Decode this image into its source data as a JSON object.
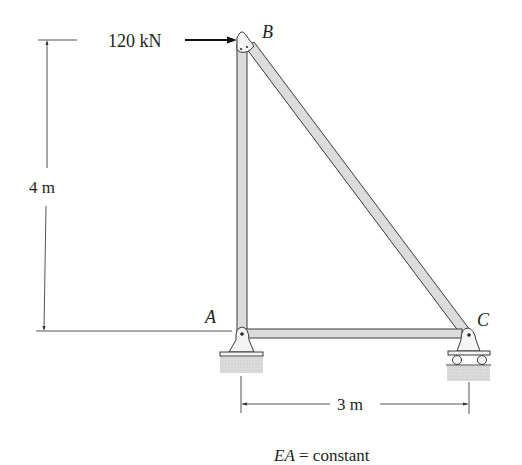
{
  "figure": {
    "type": "truss",
    "joints": [
      {
        "id": "A",
        "label": "A",
        "support": "pin"
      },
      {
        "id": "B",
        "label": "B",
        "support": "none"
      },
      {
        "id": "C",
        "label": "C",
        "support": "roller"
      }
    ],
    "members": [
      {
        "from": "A",
        "to": "B"
      },
      {
        "from": "B",
        "to": "C"
      },
      {
        "from": "A",
        "to": "C"
      }
    ],
    "load": {
      "label": "120 kN",
      "value": 120,
      "unit": "kN",
      "joint": "B",
      "direction": "right"
    },
    "dimensions": {
      "height": {
        "label": "4 m",
        "value": 4,
        "unit": "m"
      },
      "width": {
        "label": "3 m",
        "value": 3,
        "unit": "m"
      }
    },
    "note": {
      "italic": "EA",
      "text": " = constant"
    }
  },
  "colors": {
    "member_fill": "#d9d9d9",
    "member_stroke": "#3a3a3a",
    "ground": "#d4d4d4",
    "text": "#231f20",
    "dim_line": "#555555"
  }
}
